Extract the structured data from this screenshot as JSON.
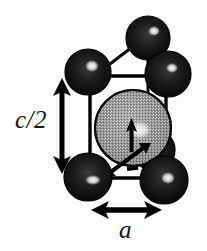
{
  "figure": {
    "kind": "crystal-unit-cell-diagram",
    "background_color": "#fdfdfb",
    "labels": {
      "vertical_dimension": "c/2",
      "horizontal_dimension": "a"
    },
    "colors": {
      "corner_atom": "#161616",
      "corner_atom_edge": "#000000",
      "corner_atom_highlight": "#ffffff",
      "center_atom_fill": "#8a8a8a",
      "center_atom_speckle": "#f2f2f2",
      "center_atom_edge": "#0d0d0d",
      "cell_edge": "#000000",
      "arrow": "#000000",
      "label_text": "#151515"
    },
    "atoms": [
      {
        "id": "corner-top-back",
        "cx": 148,
        "cy": 38,
        "r": 22,
        "type": "corner",
        "shade": "dark"
      },
      {
        "id": "corner-top-left",
        "cx": 88,
        "cy": 72,
        "r": 23,
        "type": "corner",
        "shade": "dark"
      },
      {
        "id": "corner-top-right",
        "cx": 168,
        "cy": 74,
        "r": 23,
        "type": "corner",
        "shade": "dark"
      },
      {
        "id": "atom-center-back",
        "cx": 152,
        "cy": 148,
        "r": 20,
        "type": "corner",
        "shade": "dark"
      },
      {
        "id": "corner-bottom-left",
        "cx": 88,
        "cy": 177,
        "r": 24,
        "type": "corner",
        "shade": "dark"
      },
      {
        "id": "corner-bottom-right",
        "cx": 164,
        "cy": 180,
        "r": 24,
        "type": "corner",
        "shade": "dark"
      },
      {
        "id": "atom-center-large",
        "cx": 133,
        "cy": 128,
        "r": 38,
        "type": "center",
        "shade": "stippled-gray"
      }
    ],
    "cell_edges": [
      {
        "id": "edge-top-front",
        "x1": 90,
        "y1": 76,
        "x2": 166,
        "y2": 76
      },
      {
        "id": "edge-left-front",
        "x1": 90,
        "y1": 76,
        "x2": 90,
        "y2": 178
      },
      {
        "id": "edge-right-front",
        "x1": 166,
        "y1": 76,
        "x2": 166,
        "y2": 180
      },
      {
        "id": "edge-bottom-front",
        "x1": 90,
        "y1": 178,
        "x2": 166,
        "y2": 178
      },
      {
        "id": "edge-back-left-diagonal",
        "x1": 112,
        "y1": 62,
        "x2": 134,
        "y2": 44
      },
      {
        "id": "edge-back-right-diagonal",
        "x1": 156,
        "y1": 58,
        "x2": 166,
        "y2": 72
      },
      {
        "id": "edge-back-vertical",
        "x1": 148,
        "y1": 58,
        "x2": 148,
        "y2": 146
      }
    ],
    "arrows": [
      {
        "id": "vertical-dimension-arrow",
        "orientation": "vertical",
        "x1": 62,
        "y1": 80,
        "x2": 62,
        "y2": 172,
        "double_headed": true,
        "label": "c/2"
      },
      {
        "id": "horizontal-dimension-arrow",
        "orientation": "horizontal",
        "x1": 93,
        "y1": 210,
        "x2": 162,
        "y2": 210,
        "double_headed": true,
        "label": "a"
      },
      {
        "id": "moment-arrow-diagonal",
        "orientation": "diagonal",
        "x1": 100,
        "y1": 176,
        "x2": 148,
        "y2": 142,
        "double_headed": true,
        "label": ""
      },
      {
        "id": "moment-arrow-center",
        "orientation": "up",
        "x1": 131,
        "y1": 140,
        "x2": 131,
        "y2": 118,
        "double_headed": false,
        "label": ""
      }
    ],
    "tick_marks": [
      {
        "id": "angle-tick",
        "x": 128,
        "y": 168,
        "w": 10,
        "h": 4
      }
    ]
  }
}
